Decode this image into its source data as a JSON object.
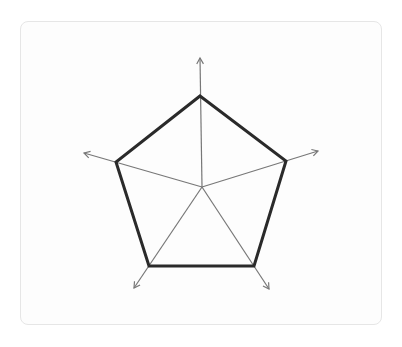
{
  "diagram": {
    "type": "radar-pentagon",
    "center": [
      202,
      187
    ],
    "vertices": [
      [
        200,
        96
      ],
      [
        286,
        161
      ],
      [
        254,
        266
      ],
      [
        149,
        266
      ],
      [
        116,
        162
      ]
    ],
    "axis_tips": [
      [
        200,
        58
      ],
      [
        318,
        151
      ],
      [
        269,
        289
      ],
      [
        134,
        288
      ],
      [
        84,
        153
      ]
    ],
    "colors": {
      "polygon_stroke": "#2a2a2a",
      "axis_stroke": "#777777",
      "card_border": "#e6e6e6",
      "card_background": "#fdfdfd"
    }
  }
}
